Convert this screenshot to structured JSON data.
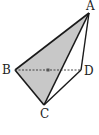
{
  "diagram": {
    "type": "tetrahedron",
    "vertices": {
      "A": {
        "label": "A",
        "x": 89,
        "y": 13
      },
      "B": {
        "label": "B",
        "x": 15,
        "y": 70
      },
      "C": {
        "label": "C",
        "x": 44,
        "y": 105
      },
      "D": {
        "label": "D",
        "x": 81,
        "y": 70
      }
    },
    "shaded_face": [
      "A",
      "B",
      "C"
    ],
    "solid_edges": [
      "AB",
      "AC",
      "BC",
      "AD",
      "CD"
    ],
    "dashed_edges": [
      "BD"
    ],
    "colors": {
      "shade": "#c8c8c8",
      "stroke": "#1a1a1a"
    }
  }
}
